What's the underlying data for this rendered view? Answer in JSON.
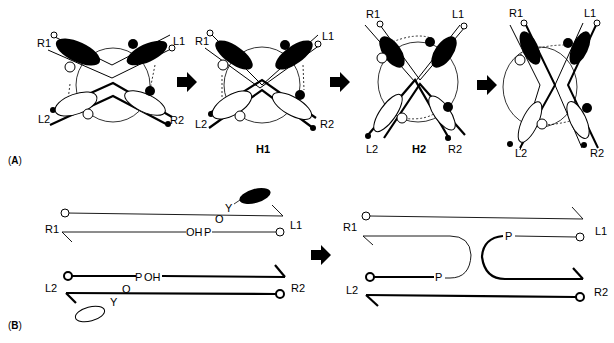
{
  "panels": {
    "A": {
      "label": "(A)",
      "stages": [
        {
          "caption": "",
          "strand_labels": {
            "R1": "R1",
            "L1": "L1",
            "L2": "L2",
            "R2": "R2"
          }
        },
        {
          "caption": "H1",
          "strand_labels": {
            "R1": "R1",
            "L1": "L1",
            "L2": "L2",
            "R2": "R2"
          }
        },
        {
          "caption": "H2",
          "strand_labels": {
            "R1": "R1",
            "L1": "L1",
            "L2": "L2",
            "R2": "R2"
          }
        },
        {
          "caption": "",
          "strand_labels": {
            "R1": "R1",
            "L1": "L1",
            "L2": "L2",
            "R2": "R2"
          }
        }
      ]
    },
    "B": {
      "label": "(B)",
      "before": {
        "strand_labels": {
          "R1": "R1",
          "L1": "L1",
          "L2": "L2",
          "R2": "R2"
        },
        "chem_top": {
          "oh": "OH",
          "p": "P",
          "o": "O",
          "y": "Y"
        },
        "chem_bottom": {
          "p": "P",
          "oh": "OH",
          "o": "O",
          "y": "Y"
        }
      },
      "after": {
        "strand_labels": {
          "R1": "R1",
          "L1": "L1",
          "L2": "L2",
          "R2": "R2"
        },
        "p_top": "P",
        "p_bottom": "P"
      }
    }
  },
  "colors": {
    "ink": "#000000",
    "paper": "#ffffff"
  }
}
